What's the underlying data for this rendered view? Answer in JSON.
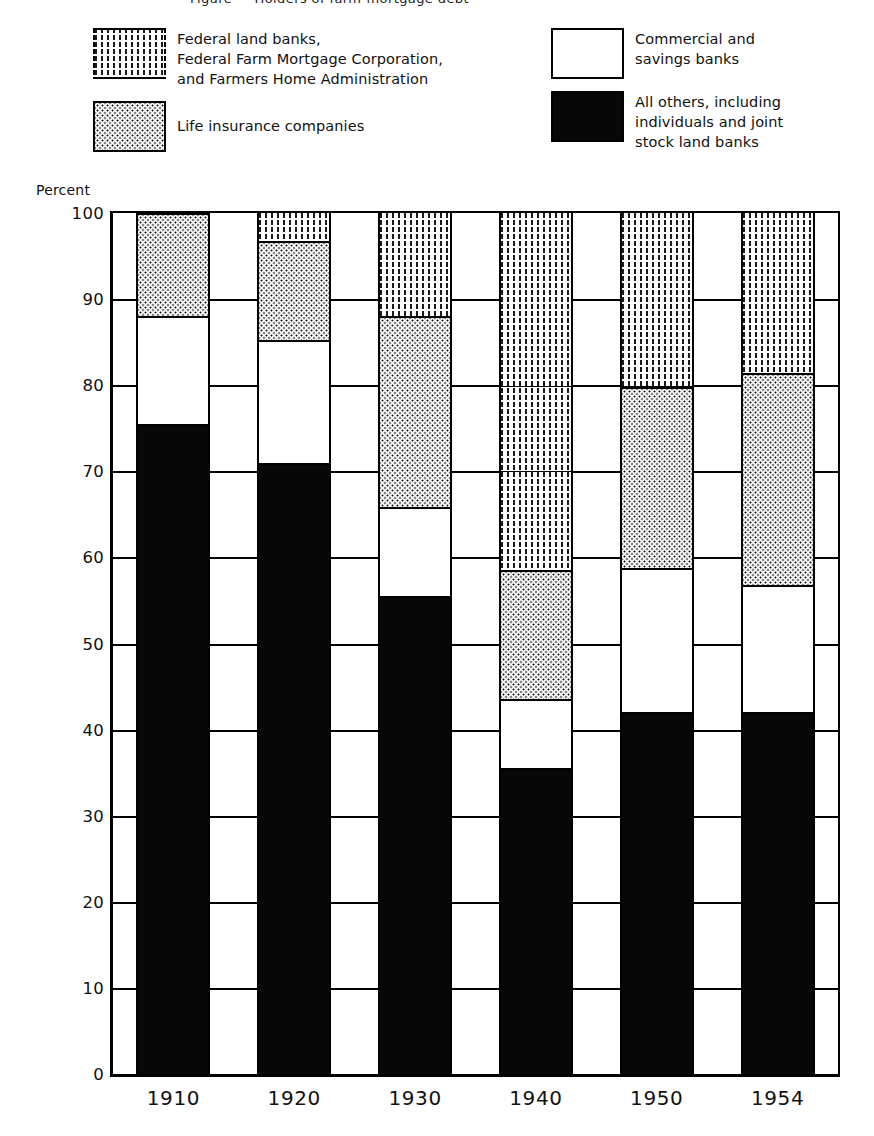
{
  "caption_clipped": "Figure — Holders of farm-mortgage debt",
  "axis": {
    "ylabel": "Percent",
    "yticks": [
      0,
      10,
      20,
      30,
      40,
      50,
      60,
      70,
      80,
      90,
      100
    ],
    "xticks": [
      "1910",
      "1920",
      "1930",
      "1940",
      "1950",
      "1954"
    ]
  },
  "legend": {
    "items": [
      {
        "key": "federal",
        "label": "Federal land banks,\nFederal Farm Mortgage Corporation,\nand Farmers Home Administration",
        "pattern": "vertical-dashed-lines",
        "color": "#1a1a1a"
      },
      {
        "key": "life",
        "label": "Life insurance companies",
        "pattern": "fine-dots",
        "color": "#111111"
      },
      {
        "key": "banks",
        "label": "Commercial and\nsavings banks",
        "pattern": "cross-hatch",
        "color": "#121212"
      },
      {
        "key": "others",
        "label": "All others, including\nindividuals and joint\nstock land banks",
        "pattern": "solid-black",
        "color": "#070707"
      }
    ]
  },
  "chart_data": {
    "type": "bar",
    "stacked": true,
    "title": "",
    "xlabel": "",
    "ylabel": "Percent",
    "ylim": [
      0,
      100
    ],
    "grid": true,
    "legend_position": "top",
    "categories": [
      "1910",
      "1920",
      "1930",
      "1940",
      "1950",
      "1954"
    ],
    "series": [
      {
        "name": "All others, including individuals and joint stock land banks",
        "key": "others",
        "pattern": "solid-black",
        "values": [
          75.5,
          71.0,
          55.5,
          35.5,
          42.0,
          42.0
        ]
      },
      {
        "name": "Commercial and savings banks",
        "key": "banks",
        "pattern": "cross-hatch",
        "values": [
          12.5,
          14.2,
          10.3,
          8.0,
          16.8,
          14.8
        ]
      },
      {
        "name": "Life insurance companies",
        "key": "life",
        "pattern": "fine-dots",
        "values": [
          12.0,
          11.6,
          22.2,
          15.0,
          21.0,
          24.6
        ]
      },
      {
        "name": "Federal land banks, Federal Farm Mortgage Corporation, and Farmers Home Administration",
        "key": "federal",
        "pattern": "vertical-dashed-lines",
        "values": [
          0.0,
          3.2,
          12.0,
          41.5,
          20.2,
          18.6
        ]
      }
    ],
    "stack_order_bottom_to_top": [
      "others",
      "banks",
      "life",
      "federal"
    ],
    "cumulative_tops": {
      "1910": {
        "others": 75.5,
        "banks": 88.0,
        "life": 100.0,
        "federal": 100.0
      },
      "1920": {
        "others": 71.0,
        "banks": 85.2,
        "life": 96.8,
        "federal": 100.0
      },
      "1930": {
        "others": 55.5,
        "banks": 65.8,
        "life": 88.0,
        "federal": 100.0
      },
      "1940": {
        "others": 35.5,
        "banks": 43.5,
        "life": 58.5,
        "federal": 100.0
      },
      "1950": {
        "others": 42.0,
        "banks": 58.8,
        "life": 79.8,
        "federal": 100.0
      },
      "1954": {
        "others": 42.0,
        "banks": 56.8,
        "life": 81.4,
        "federal": 100.0
      }
    }
  }
}
